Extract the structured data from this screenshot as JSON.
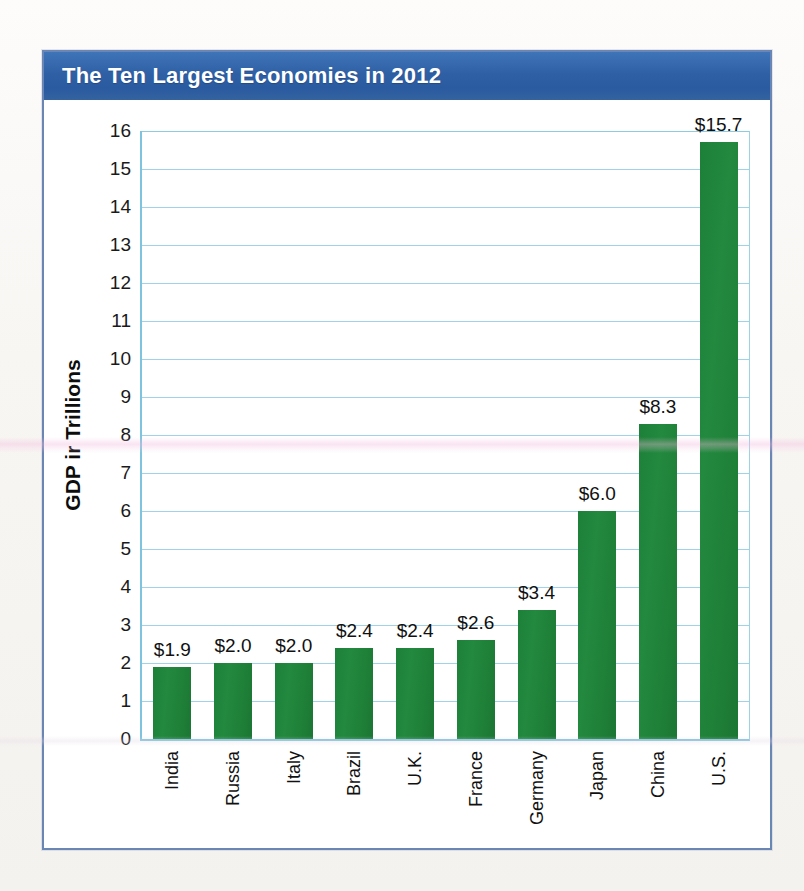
{
  "figure": {
    "title": "The Ten Largest Economies in 2012",
    "title_bar_color": "#2f60a6",
    "frame_color": "#6a86b4",
    "background_color": "#ffffff"
  },
  "chart_data": {
    "type": "bar",
    "title": "The Ten Largest Economies in 2012",
    "xlabel": "",
    "ylabel": "GDP in Trillions",
    "ylabel_rendered": "GDP ir Trillions",
    "ylim": [
      0,
      16
    ],
    "ytick_step": 1,
    "yticks": [
      16,
      15,
      14,
      13,
      12,
      11,
      10,
      9,
      8,
      7,
      6,
      5,
      4,
      3,
      2,
      1,
      0
    ],
    "ytick_labels": [
      "16",
      "15",
      "14",
      "13",
      "12",
      "11",
      "10",
      "9",
      "8",
      "7",
      "6",
      "5",
      "4",
      "3",
      "2",
      "1",
      "0"
    ],
    "grid": true,
    "grid_color": "#9ed3e8",
    "legend": "none",
    "bar_color": "#1f8038",
    "categories": [
      "India",
      "Russia",
      "Italy",
      "Brazil",
      "U.K.",
      "France",
      "Germany",
      "Japan",
      "China",
      "U.S."
    ],
    "values": [
      1.9,
      2.0,
      2.0,
      2.4,
      2.4,
      2.6,
      3.4,
      6.0,
      8.3,
      15.7
    ],
    "data_labels": [
      "$1.9",
      "$2.0",
      "$2.0",
      "$2.4",
      "$2.4",
      "$2.6",
      "$3.4",
      "$6.0",
      "$8.3",
      "$15.7"
    ],
    "units": "trillions of US dollars"
  }
}
